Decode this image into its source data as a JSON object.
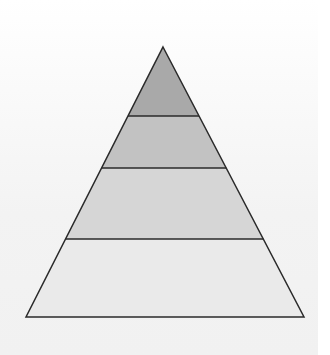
{
  "diagram": {
    "type": "pyramid",
    "levels_count": 4,
    "apex": {
      "x": 163,
      "y": 47
    },
    "base": {
      "y": 317,
      "left_x": 26,
      "right_x": 304
    },
    "divider_ys": [
      116,
      168,
      239
    ],
    "stroke_color": "#2a2a2a",
    "levels": [
      {
        "index": 1,
        "position": "top",
        "label": "",
        "fill": "#a9a9a9"
      },
      {
        "index": 2,
        "position": "upper-middle",
        "label": "",
        "fill": "#c2c2c2"
      },
      {
        "index": 3,
        "position": "lower-middle",
        "label": "",
        "fill": "#d6d6d6"
      },
      {
        "index": 4,
        "position": "bottom",
        "label": "",
        "fill": "#eaeaea"
      }
    ]
  },
  "background": {
    "main": "#f3f3f3",
    "edge": "#ffffff"
  }
}
